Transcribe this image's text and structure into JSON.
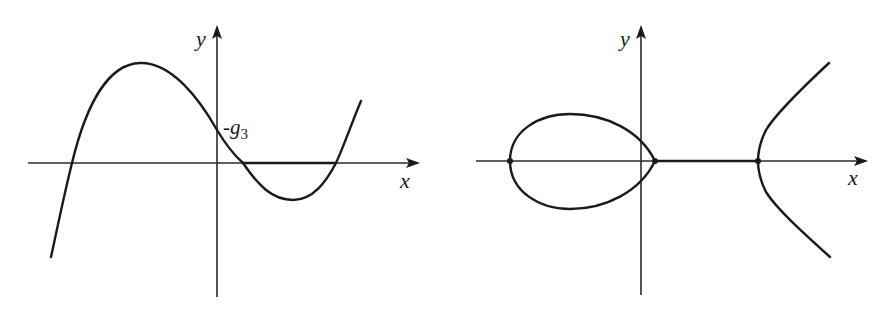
{
  "figure": {
    "panels": [
      {
        "id": "left",
        "description": "Cubic curve y = f(x) with three real roots",
        "x_axis_label": "x",
        "y_axis_label": "y",
        "y_intercept_label": "-g",
        "y_intercept_subscript": "3"
      },
      {
        "id": "right",
        "description": "Elliptic curve with two real components (oval and unbounded branch)",
        "x_axis_label": "x",
        "y_axis_label": "y"
      }
    ],
    "colors": {
      "stroke": "#1a1a1a",
      "axis": "#2a2a2a",
      "background": "#ffffff"
    }
  }
}
